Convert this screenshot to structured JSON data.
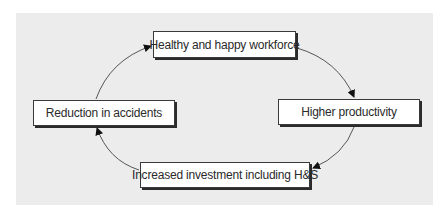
{
  "diagram": {
    "type": "cycle",
    "nodes": [
      {
        "id": "top",
        "label": "Healthy and happy workforce"
      },
      {
        "id": "right",
        "label": "Higher productivity"
      },
      {
        "id": "bottom",
        "label": "Increased investment including H&S"
      },
      {
        "id": "left",
        "label": "Reduction in accidents"
      }
    ],
    "edges": [
      {
        "from": "top",
        "to": "right"
      },
      {
        "from": "right",
        "to": "bottom"
      },
      {
        "from": "bottom",
        "to": "left"
      },
      {
        "from": "left",
        "to": "top"
      }
    ],
    "colors": {
      "panel": "#ececec",
      "box_fill": "#ffffff",
      "box_border": "#3a3a3a",
      "arrow": "#333333"
    }
  }
}
